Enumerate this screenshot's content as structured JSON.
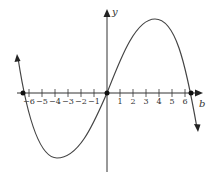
{
  "chart_data": {
    "type": "line",
    "title": "",
    "xlabel": "b",
    "ylabel": "y",
    "x_ticks": [
      -6,
      -5,
      -4,
      -3,
      -2,
      -1,
      1,
      2,
      3,
      4,
      5,
      6
    ],
    "x_tick_labels": [
      "−6",
      "−5",
      "−4",
      "−3",
      "−2",
      "−1",
      "1",
      "2",
      "3",
      "4",
      "5",
      "6"
    ],
    "xlim": [
      -7,
      7
    ],
    "grid": false,
    "series": [
      {
        "name": "curve",
        "description": "cubic-shaped curve through origin, roots near -6.5, 0, 6.5; local min near x=-3.8, local max near x=3.6",
        "points": [
          [
            -6.9,
            2.7
          ],
          [
            -6.5,
            0
          ],
          [
            -3.8,
            -5
          ],
          [
            0,
            0
          ],
          [
            3.6,
            5.7
          ],
          [
            6.5,
            0
          ],
          [
            6.9,
            -2.7
          ]
        ],
        "marked_points": [
          [
            -6.5,
            0
          ],
          [
            0,
            0
          ],
          [
            6.5,
            0
          ]
        ]
      }
    ]
  }
}
